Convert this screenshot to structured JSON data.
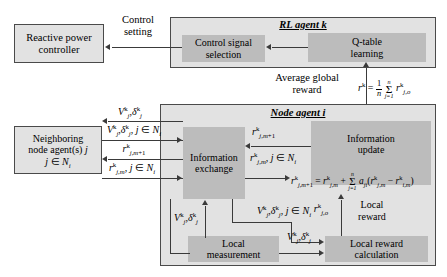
{
  "diagram": {
    "colors": {
      "outer_fill": "#e2e2e2",
      "inner_fill": "#bcbcbc",
      "border": "#4a4a4a",
      "line": "#3a3a3a"
    }
  },
  "boxes": {
    "reactive_power_controller": {
      "line1": "Reactive power",
      "line2": "controller"
    },
    "rl_agent": {
      "title": "RL agent k"
    },
    "control_signal_selection": {
      "line1": "Control signal",
      "line2": "selection"
    },
    "q_table_learning": {
      "line1": "Q-table",
      "line2": "learning"
    },
    "node_agent": {
      "title": "Node agent i"
    },
    "neighboring_node": {
      "line1": "Neighboring",
      "line2": "node agent(s) j",
      "line3": "j ∈ Ni"
    },
    "information_exchange": {
      "line1": "Information",
      "line2": "exchange"
    },
    "information_update": {
      "line1": "Information",
      "line2": "update"
    },
    "local_measurement": {
      "line1": "Local",
      "line2": "measurement"
    },
    "local_reward_calculation": {
      "line1": "Local reward",
      "line2": "calculation"
    }
  },
  "labels": {
    "control_setting": {
      "line1": "Control",
      "line2": "setting"
    },
    "average_global_reward": {
      "line1": "Average global",
      "line2": "reward"
    },
    "local_reward": {
      "line1": "Local",
      "line2": "reward"
    },
    "global_reward_formula": "r^k = (1/n) Σ j=1..n r^k_{j,o}",
    "consensus_formula": "r^k_{j,m+1} = r^k_{j,m} + Σ j=1..n a_ji ( r^k_{j,m} − r^k_{i,m} )",
    "v_delta": "V^k_j , δ^k_j",
    "v_delta_neighbors": "V^k_j , δ^k_j , j ∈ Ni",
    "r_jm1": "r^k_{j,m+1}",
    "r_jm_neighbors": "r^k_{j,m} , j ∈ Ni",
    "r_jo": "r^k_{j,o}"
  }
}
